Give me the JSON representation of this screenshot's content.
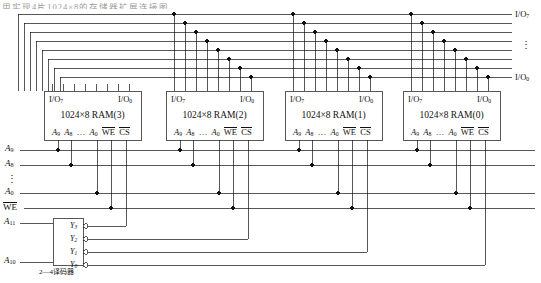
{
  "figure": {
    "type": "logic-circuit-diagram",
    "top_clipped_text": "用实现4片1024×8的存储器扩展连接图"
  },
  "rams": [
    {
      "id": "ram3",
      "title": "1024×8 RAM(3)",
      "io_high": "I/O",
      "io_high_sub": "7",
      "io_low": "I/O",
      "io_low_sub": "0",
      "pins": [
        "A9",
        "A8",
        "...",
        "A0",
        "WE",
        "CS"
      ]
    },
    {
      "id": "ram2",
      "title": "1024×8 RAM(2)",
      "io_high": "I/O",
      "io_high_sub": "7",
      "io_low": "I/O",
      "io_low_sub": "0",
      "pins": [
        "A9",
        "A8",
        "...",
        "A0",
        "WE",
        "CS"
      ]
    },
    {
      "id": "ram1",
      "title": "1024×8 RAM(1)",
      "io_high": "I/O",
      "io_high_sub": "7",
      "io_low": "I/O",
      "io_low_sub": "0",
      "pins": [
        "A9",
        "A8",
        "...",
        "A0",
        "WE",
        "CS"
      ]
    },
    {
      "id": "ram0",
      "title": "1024×8 RAM(0)",
      "io_high": "I/O",
      "io_high_sub": "7",
      "io_low": "I/O",
      "io_low_sub": "0",
      "pins": [
        "A9",
        "A8",
        "...",
        "A0",
        "WE",
        "CS"
      ]
    }
  ],
  "pin_labels": {
    "a9": "A",
    "a9_sub": "9",
    "a8": "A",
    "a8_sub": "8",
    "ellipsis": "…",
    "a0": "A",
    "a0_sub": "0",
    "we": "WE",
    "cs": "CS"
  },
  "left_signals": [
    {
      "name": "A",
      "sub": "9",
      "overline": false
    },
    {
      "name": "A",
      "sub": "8",
      "overline": false
    },
    {
      "name": "⋮",
      "sub": "",
      "overline": false
    },
    {
      "name": "A",
      "sub": "0",
      "overline": false
    },
    {
      "name": "WE",
      "sub": "",
      "overline": true
    },
    {
      "name": "A",
      "sub": "11",
      "overline": false
    },
    {
      "name": "A",
      "sub": "10",
      "overline": false
    }
  ],
  "decoder": {
    "caption": "2—4译码器",
    "outputs": [
      {
        "label": "Y",
        "sub": "3"
      },
      {
        "label": "Y",
        "sub": "2"
      },
      {
        "label": "Y",
        "sub": "1"
      },
      {
        "label": "Y",
        "sub": "0"
      }
    ],
    "inputs": [
      {
        "label": "A",
        "sub": "11"
      },
      {
        "label": "A",
        "sub": "10"
      }
    ]
  },
  "data_bus": {
    "top_label": "I/O",
    "top_sub": "7",
    "bottom_label": "I/O",
    "bottom_sub": "0",
    "middle_marker": "⋮",
    "line_count": 8
  },
  "colors": {
    "wire": "#111111",
    "box_border": "#111111",
    "background": "#ffffff",
    "faded_text": "#9a9a9a"
  }
}
